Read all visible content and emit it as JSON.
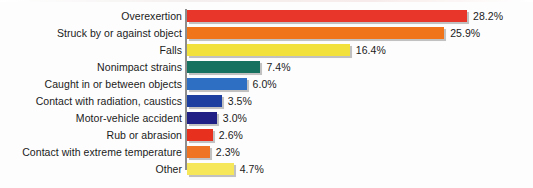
{
  "chart_data": {
    "type": "bar",
    "orientation": "horizontal",
    "title": "",
    "subtitle": "",
    "xlabel": "",
    "ylabel": "",
    "xlim": [
      0,
      28.2
    ],
    "grid": false,
    "legend": false,
    "value_suffix": "%",
    "categories": [
      "Overexertion",
      "Struck by or against object",
      "Falls",
      "Nonimpact strains",
      "Caught in or between objects",
      "Contact with radiation, caustics",
      "Motor-vehicle accident",
      "Rub or abrasion",
      "Contact with extreme temperature",
      "Other"
    ],
    "values": [
      28.2,
      25.9,
      16.4,
      7.4,
      6.0,
      3.5,
      3.0,
      2.6,
      2.3,
      4.7
    ],
    "value_labels": [
      "28.2%",
      "25.9%",
      "16.4%",
      "7.4%",
      "6.0%",
      "3.5%",
      "3.0%",
      "2.6%",
      "2.3%",
      "4.7%"
    ],
    "colors": [
      "#e8362a",
      "#f07419",
      "#f2e03c",
      "#17715f",
      "#2e6fc4",
      "#1c3fa0",
      "#201f86",
      "#e8301f",
      "#ef7423",
      "#f5e65a"
    ],
    "bars": [
      {
        "label": "Overexertion",
        "value": 28.2,
        "value_label": "28.2%",
        "color": "#e8362a"
      },
      {
        "label": "Struck by or against object",
        "value": 25.9,
        "value_label": "25.9%",
        "color": "#f07419"
      },
      {
        "label": "Falls",
        "value": 16.4,
        "value_label": "16.4%",
        "color": "#f2e03c"
      },
      {
        "label": "Nonimpact strains",
        "value": 7.4,
        "value_label": "7.4%",
        "color": "#17715f"
      },
      {
        "label": "Caught in or between objects",
        "value": 6.0,
        "value_label": "6.0%",
        "color": "#2e6fc4"
      },
      {
        "label": "Contact with radiation, caustics",
        "value": 3.5,
        "value_label": "3.5%",
        "color": "#1c3fa0"
      },
      {
        "label": "Motor-vehicle accident",
        "value": 3.0,
        "value_label": "3.0%",
        "color": "#201f86"
      },
      {
        "label": "Rub or abrasion",
        "value": 2.6,
        "value_label": "2.6%",
        "color": "#e8301f"
      },
      {
        "label": "Contact with extreme temperature",
        "value": 2.3,
        "value_label": "2.3%",
        "color": "#ef7423"
      },
      {
        "label": "Other",
        "value": 4.7,
        "value_label": "4.7%",
        "color": "#f5e65a"
      }
    ],
    "axis_color": "#8d8d8d"
  }
}
